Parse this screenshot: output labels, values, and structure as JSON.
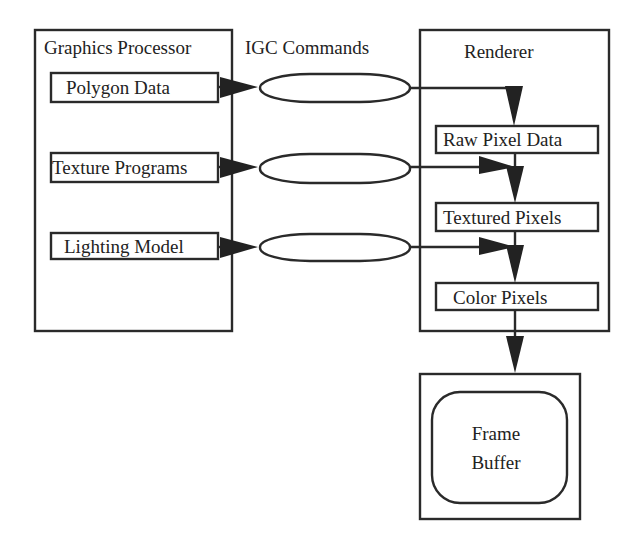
{
  "diagram": {
    "graphics_processor": {
      "title": "Graphics Processor",
      "inputs": [
        {
          "label": "Polygon Data"
        },
        {
          "label": "Texture Programs"
        },
        {
          "label": "Lighting Model"
        }
      ]
    },
    "igc": {
      "title": "IGC Commands",
      "channels": 3
    },
    "renderer": {
      "title": "Renderer",
      "stages": [
        {
          "label": "Raw Pixel Data"
        },
        {
          "label": "Textured Pixels"
        },
        {
          "label": "Color Pixels"
        }
      ]
    },
    "frame_buffer": {
      "line1": "Frame",
      "line2": "Buffer"
    },
    "colors": {
      "stroke": "#2a2a2a",
      "background": "#ffffff"
    }
  }
}
